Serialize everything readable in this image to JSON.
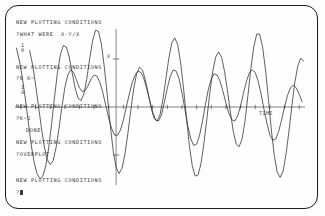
{
  "screen": {
    "kind": "crt-terminal-plot",
    "bezel_color": "#1c1c1c",
    "background_color": "#fefefd",
    "ink_color": "#3a3a3a"
  },
  "terminal": {
    "lines": [
      {
        "text": "NEW PLOTTING CONDITIONS",
        "x": 16,
        "y": 19
      },
      {
        "text": "?WHAT WERE  X-Y/X",
        "x": 16,
        "y": 31
      },
      {
        "text": "NEW PLOTTING CONDITIONS",
        "x": 16,
        "y": 64
      },
      {
        "text": "?N K=",
        "x": 16,
        "y": 75
      },
      {
        "text": "NEW PLOTTING CONDITIONS",
        "x": 16,
        "y": 103
      },
      {
        "text": "?K=2",
        "x": 16,
        "y": 115
      },
      {
        "text": "DONE",
        "x": 26,
        "y": 127
      },
      {
        "text": "NEW PLOTTING CONDITIONS",
        "x": 16,
        "y": 139
      },
      {
        "text": "?OVERPLOT",
        "x": 16,
        "y": 151
      },
      {
        "text": "NEW PLOTTING CONDITIONS",
        "x": 16,
        "y": 177
      }
    ],
    "prompt": {
      "text": "?",
      "x": 16,
      "y": 189
    },
    "fractions": [
      {
        "numerator": "1",
        "denominator": "0",
        "x": 21,
        "y": 43
      },
      {
        "numerator": "1",
        "denominator": "4",
        "x": 21,
        "y": 85
      }
    ]
  },
  "chart_data": {
    "type": "line",
    "title": "",
    "xlabel": "TIME",
    "ylabel": "X",
    "xlim": [
      -3.45,
      6.55
    ],
    "ylim": [
      -1.25,
      1.25
    ],
    "grid": false,
    "legend": "none",
    "axes": {
      "y_axis_x_value": 0.0,
      "x_axis_y_value": 0.0,
      "x_tick_count": 21,
      "x_tick_step": 0.5,
      "y_ticks": [
        0.75,
        -0.75
      ],
      "y_axis_top": 1.22,
      "y_axis_bottom": -1.22,
      "x_axis_left": -3.45,
      "x_axis_right": 6.45
    },
    "series": [
      {
        "name": "large-amplitude-oscillation",
        "color": "#2b2b2b",
        "points": [
          [
            -3.4,
            0.92
          ],
          [
            -3.3,
            0.72
          ],
          [
            -3.2,
            0.46
          ],
          [
            -3.1,
            0.14
          ],
          [
            -3.0,
            -0.22
          ],
          [
            -2.9,
            -0.58
          ],
          [
            -2.8,
            -0.86
          ],
          [
            -2.7,
            -1.04
          ],
          [
            -2.6,
            -1.12
          ],
          [
            -2.5,
            -1.08
          ],
          [
            -2.4,
            -0.92
          ],
          [
            -2.3,
            -0.64
          ],
          [
            -2.2,
            -0.26
          ],
          [
            -2.1,
            0.16
          ],
          [
            -2.0,
            0.54
          ],
          [
            -1.9,
            0.82
          ],
          [
            -1.8,
            0.96
          ],
          [
            -1.7,
            0.94
          ],
          [
            -1.6,
            0.78
          ],
          [
            -1.5,
            0.54
          ],
          [
            -1.4,
            0.3
          ],
          [
            -1.3,
            0.14
          ],
          [
            -1.2,
            0.1
          ],
          [
            -1.1,
            0.2
          ],
          [
            -1.0,
            0.44
          ],
          [
            -0.9,
            0.76
          ],
          [
            -0.8,
            1.04
          ],
          [
            -0.7,
            1.2
          ],
          [
            -0.6,
            1.18
          ],
          [
            -0.5,
            0.98
          ],
          [
            -0.4,
            0.62
          ],
          [
            -0.3,
            0.18
          ],
          [
            -0.2,
            -0.28
          ],
          [
            -0.1,
            -0.68
          ],
          [
            0.0,
            -0.94
          ],
          [
            0.1,
            -1.04
          ],
          [
            0.2,
            -0.96
          ],
          [
            0.3,
            -0.74
          ],
          [
            0.4,
            -0.42
          ],
          [
            0.5,
            -0.06
          ],
          [
            0.6,
            0.28
          ],
          [
            0.7,
            0.52
          ],
          [
            0.8,
            0.62
          ],
          [
            0.9,
            0.58
          ],
          [
            1.0,
            0.42
          ],
          [
            1.1,
            0.2
          ],
          [
            1.2,
            -0.02
          ],
          [
            1.3,
            -0.18
          ],
          [
            1.4,
            -0.22
          ],
          [
            1.5,
            -0.12
          ],
          [
            1.6,
            0.12
          ],
          [
            1.7,
            0.44
          ],
          [
            1.8,
            0.76
          ],
          [
            1.9,
            1.0
          ],
          [
            2.0,
            1.08
          ],
          [
            2.1,
            0.98
          ],
          [
            2.2,
            0.7
          ],
          [
            2.3,
            0.3
          ],
          [
            2.4,
            -0.16
          ],
          [
            2.5,
            -0.6
          ],
          [
            2.6,
            -0.92
          ],
          [
            2.7,
            -1.08
          ],
          [
            2.8,
            -1.06
          ],
          [
            2.9,
            -0.88
          ],
          [
            3.0,
            -0.56
          ],
          [
            3.1,
            -0.18
          ],
          [
            3.2,
            0.22
          ],
          [
            3.3,
            0.56
          ],
          [
            3.4,
            0.78
          ],
          [
            3.5,
            0.86
          ],
          [
            3.6,
            0.78
          ],
          [
            3.7,
            0.56
          ],
          [
            3.8,
            0.26
          ],
          [
            3.9,
            -0.08
          ],
          [
            4.0,
            -0.38
          ],
          [
            4.1,
            -0.58
          ],
          [
            4.2,
            -0.62
          ],
          [
            4.3,
            -0.5
          ],
          [
            4.4,
            -0.22
          ],
          [
            4.5,
            0.18
          ],
          [
            4.6,
            0.6
          ],
          [
            4.7,
            0.94
          ],
          [
            4.8,
            1.14
          ],
          [
            4.9,
            1.14
          ],
          [
            5.0,
            0.94
          ],
          [
            5.1,
            0.58
          ],
          [
            5.2,
            0.12
          ],
          [
            5.3,
            -0.36
          ],
          [
            5.4,
            -0.76
          ],
          [
            5.5,
            -1.02
          ],
          [
            5.6,
            -1.1
          ],
          [
            5.7,
            -1.0
          ],
          [
            5.8,
            -0.74
          ],
          [
            5.9,
            -0.38
          ],
          [
            6.0,
            0.02
          ],
          [
            6.1,
            0.38
          ],
          [
            6.2,
            0.64
          ],
          [
            6.3,
            0.76
          ],
          [
            6.4,
            0.72
          ]
        ]
      },
      {
        "name": "small-amplitude-oscillation",
        "color": "#2b2b2b",
        "points": [
          [
            -2.95,
            0.88
          ],
          [
            -2.85,
            0.66
          ],
          [
            -2.75,
            0.36
          ],
          [
            -2.65,
            0.02
          ],
          [
            -2.55,
            -0.32
          ],
          [
            -2.45,
            -0.62
          ],
          [
            -2.35,
            -0.82
          ],
          [
            -2.25,
            -0.9
          ],
          [
            -2.15,
            -0.84
          ],
          [
            -2.05,
            -0.64
          ],
          [
            -1.95,
            -0.34
          ],
          [
            -1.85,
            0.0
          ],
          [
            -1.75,
            0.3
          ],
          [
            -1.65,
            0.5
          ],
          [
            -1.55,
            0.58
          ],
          [
            -1.45,
            0.54
          ],
          [
            -1.35,
            0.42
          ],
          [
            -1.25,
            0.3
          ],
          [
            -1.15,
            0.24
          ],
          [
            -1.05,
            0.26
          ],
          [
            -0.95,
            0.34
          ],
          [
            -0.85,
            0.44
          ],
          [
            -0.75,
            0.5
          ],
          [
            -0.65,
            0.48
          ],
          [
            -0.55,
            0.38
          ],
          [
            -0.45,
            0.22
          ],
          [
            -0.35,
            0.02
          ],
          [
            -0.25,
            -0.18
          ],
          [
            -0.15,
            -0.34
          ],
          [
            -0.05,
            -0.44
          ],
          [
            0.05,
            -0.44
          ],
          [
            0.15,
            -0.36
          ],
          [
            0.25,
            -0.2
          ],
          [
            0.35,
            0.0
          ],
          [
            0.45,
            0.2
          ],
          [
            0.55,
            0.38
          ],
          [
            0.65,
            0.5
          ],
          [
            0.75,
            0.56
          ],
          [
            0.85,
            0.54
          ],
          [
            0.95,
            0.44
          ],
          [
            1.05,
            0.28
          ],
          [
            1.15,
            0.1
          ],
          [
            1.25,
            -0.08
          ],
          [
            1.35,
            -0.2
          ],
          [
            1.45,
            -0.22
          ],
          [
            1.55,
            -0.12
          ],
          [
            1.65,
            0.08
          ],
          [
            1.75,
            0.3
          ],
          [
            1.85,
            0.48
          ],
          [
            1.95,
            0.58
          ],
          [
            2.05,
            0.56
          ],
          [
            2.15,
            0.44
          ],
          [
            2.25,
            0.22
          ],
          [
            2.35,
            -0.04
          ],
          [
            2.45,
            -0.3
          ],
          [
            2.55,
            -0.5
          ],
          [
            2.65,
            -0.6
          ],
          [
            2.75,
            -0.58
          ],
          [
            2.85,
            -0.44
          ],
          [
            2.95,
            -0.22
          ],
          [
            3.05,
            0.04
          ],
          [
            3.15,
            0.28
          ],
          [
            3.25,
            0.44
          ],
          [
            3.35,
            0.52
          ],
          [
            3.45,
            0.5
          ],
          [
            3.55,
            0.4
          ],
          [
            3.65,
            0.24
          ],
          [
            3.75,
            0.06
          ],
          [
            3.85,
            -0.1
          ],
          [
            3.95,
            -0.2
          ],
          [
            4.05,
            -0.22
          ],
          [
            4.15,
            -0.14
          ],
          [
            4.25,
            0.02
          ],
          [
            4.35,
            0.22
          ],
          [
            4.45,
            0.4
          ],
          [
            4.55,
            0.54
          ],
          [
            4.65,
            0.58
          ],
          [
            4.75,
            0.54
          ],
          [
            4.85,
            0.4
          ],
          [
            4.95,
            0.2
          ],
          [
            5.05,
            -0.04
          ],
          [
            5.15,
            -0.26
          ],
          [
            5.25,
            -0.44
          ],
          [
            5.35,
            -0.52
          ],
          [
            5.45,
            -0.5
          ],
          [
            5.55,
            -0.38
          ],
          [
            5.65,
            -0.2
          ],
          [
            5.75,
            0.0
          ],
          [
            5.85,
            0.18
          ],
          [
            5.95,
            0.3
          ],
          [
            6.05,
            0.34
          ],
          [
            6.15,
            0.3
          ],
          [
            6.25,
            0.2
          ],
          [
            6.35,
            0.08
          ]
        ]
      }
    ]
  }
}
